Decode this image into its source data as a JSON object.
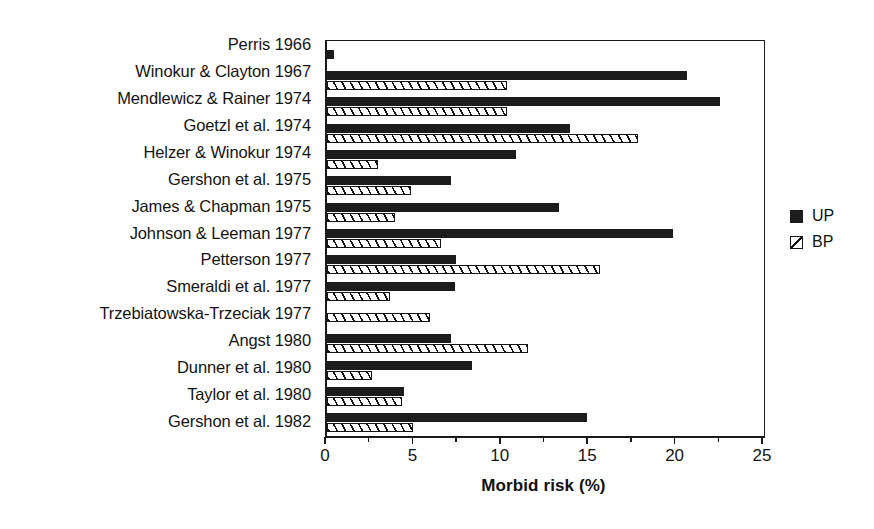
{
  "chart_data": {
    "type": "bar",
    "orientation": "horizontal",
    "title": "",
    "xlabel": "Morbid risk (%)",
    "ylabel": "",
    "xlim": [
      0,
      25
    ],
    "xticks": [
      0,
      5,
      10,
      15,
      20,
      25
    ],
    "xtick_labels": [
      "0",
      "5",
      "10",
      "15",
      "20",
      "25"
    ],
    "minor_xticks": [
      2.5,
      7.5,
      12.5,
      17.5,
      22.5
    ],
    "grid": false,
    "legend_position": "right",
    "categories": [
      "Perris 1966",
      "Winokur & Clayton 1967",
      "Mendlewicz & Rainer 1974",
      "Goetzl et al. 1974",
      "Helzer & Winokur 1974",
      "Gershon et al. 1975",
      "James & Chapman 1975",
      "Johnson & Leeman 1977",
      "Petterson 1977",
      "Smeraldi et al. 1977",
      "Trzebiatowska-Trzeciak 1977",
      "Angst 1980",
      "Dunner et al. 1980",
      "Taylor et al. 1980",
      "Gershon et al. 1982"
    ],
    "series": [
      {
        "name": "UP",
        "color": "#1c1c1c",
        "fill": "solid",
        "values": [
          0.4,
          20.6,
          22.5,
          13.9,
          10.8,
          7.1,
          13.3,
          19.8,
          7.4,
          7.3,
          0,
          7.1,
          8.3,
          4.4,
          14.9
        ]
      },
      {
        "name": "BP",
        "color": "#ffffff",
        "fill": "hatched",
        "values": [
          0,
          10.3,
          10.3,
          17.8,
          2.9,
          4.8,
          3.9,
          6.5,
          15.6,
          3.6,
          5.9,
          11.5,
          2.6,
          4.3,
          4.9
        ]
      }
    ]
  },
  "legend": {
    "items": [
      {
        "label": "UP",
        "swatch": "solid-black-square"
      },
      {
        "label": "BP",
        "swatch": "hatched-square"
      }
    ]
  },
  "axis": {
    "x_title": "Morbid risk (%)"
  }
}
